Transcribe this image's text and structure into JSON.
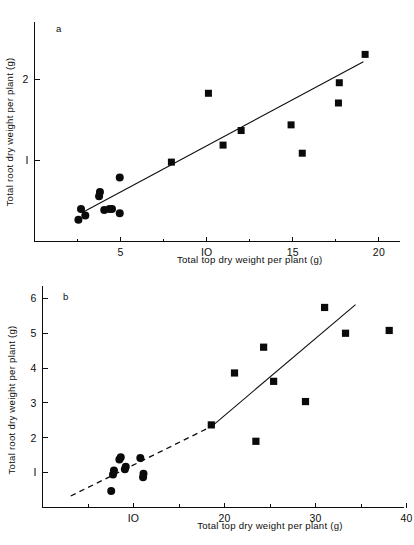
{
  "figure": {
    "panels": [
      {
        "id": "a",
        "letter": "a",
        "xlabel": "Total top dry weight per plant (g)",
        "ylabel": "Total root dry weight per plant (g)",
        "xticks": [
          5,
          10,
          15,
          20
        ],
        "yticks": [
          1,
          2
        ],
        "xlim": [
          0.0,
          21.2
        ],
        "ylim": [
          0.0,
          2.42
        ]
      },
      {
        "id": "b",
        "letter": "b",
        "xlabel": "Total top dry weight per plant (g)",
        "ylabel": "Total root dry weight per plant (g)",
        "xticks": [
          10,
          20,
          30,
          40
        ],
        "yticks": [
          1,
          2,
          3,
          4,
          5,
          6
        ],
        "xlim": [
          0.0,
          41.5
        ],
        "ylim": [
          0.0,
          6.28
        ]
      }
    ]
  },
  "chart_data": [
    {
      "type": "scatter",
      "panel": "a",
      "title": "",
      "xlabel": "Total top dry weight per plant (g)",
      "ylabel": "Total root dry weight per plant (g)",
      "xlim": [
        0.0,
        21.2
      ],
      "ylim": [
        0.0,
        2.42
      ],
      "xticks": [
        5,
        10,
        15,
        20
      ],
      "yticks": [
        1,
        2
      ],
      "grid": false,
      "legend": null,
      "annotations": [
        "a"
      ],
      "series": [
        {
          "name": "circles",
          "marker": "circle",
          "color": "#0a0a0a",
          "points": [
            [
              2.55,
              0.27
            ],
            [
              2.7,
              0.4
            ],
            [
              2.95,
              0.32
            ],
            [
              3.75,
              0.56
            ],
            [
              3.8,
              0.61
            ],
            [
              4.05,
              0.39
            ],
            [
              4.35,
              0.4
            ],
            [
              4.5,
              0.4
            ],
            [
              4.95,
              0.35
            ],
            [
              4.95,
              0.79
            ]
          ]
        },
        {
          "name": "squares",
          "marker": "square",
          "color": "#0a0a0a",
          "points": [
            [
              7.95,
              0.98
            ],
            [
              10.1,
              1.83
            ],
            [
              10.95,
              1.19
            ],
            [
              12.0,
              1.37
            ],
            [
              14.9,
              1.44
            ],
            [
              15.55,
              1.09
            ],
            [
              17.65,
              1.71
            ],
            [
              17.7,
              1.96
            ],
            [
              19.2,
              2.31
            ]
          ]
        }
      ],
      "fit_lines": [
        {
          "name": "regression-line-a",
          "style": "solid",
          "x_start": 2.75,
          "y_start": 0.355,
          "x_end": 19.1,
          "y_end": 2.22
        }
      ]
    },
    {
      "type": "scatter",
      "panel": "b",
      "title": "",
      "xlabel": "Total top dry weight per plant (g)",
      "ylabel": "Total root dry weight per plant (g)",
      "xlim": [
        0.0,
        41.5
      ],
      "ylim": [
        0.0,
        6.28
      ],
      "xticks": [
        10,
        20,
        30,
        40
      ],
      "yticks": [
        1,
        2,
        3,
        4,
        5,
        6
      ],
      "grid": false,
      "legend": null,
      "annotations": [
        "b"
      ],
      "series": [
        {
          "name": "circles",
          "marker": "circle",
          "color": "#0a0a0a",
          "points": [
            [
              7.55,
              0.47
            ],
            [
              7.75,
              0.95
            ],
            [
              7.85,
              1.06
            ],
            [
              8.45,
              1.38
            ],
            [
              8.6,
              1.44
            ],
            [
              9.05,
              1.1
            ],
            [
              9.15,
              1.17
            ],
            [
              10.75,
              1.42
            ],
            [
              11.05,
              0.87
            ],
            [
              11.1,
              0.97
            ]
          ]
        },
        {
          "name": "squares",
          "marker": "square",
          "color": "#0a0a0a",
          "points": [
            [
              18.55,
              2.37
            ],
            [
              21.1,
              3.86
            ],
            [
              23.45,
              1.9
            ],
            [
              24.3,
              4.6
            ],
            [
              25.4,
              3.62
            ],
            [
              28.9,
              3.04
            ],
            [
              31.0,
              5.74
            ],
            [
              33.3,
              5.0
            ],
            [
              38.1,
              5.08
            ]
          ]
        }
      ],
      "fit_lines": [
        {
          "name": "regression-line-b-extrapolated",
          "style": "dashed",
          "x_start": 3.1,
          "y_start": 0.33,
          "x_end": 18.6,
          "y_end": 2.33
        },
        {
          "name": "regression-line-b",
          "style": "solid",
          "x_start": 18.6,
          "y_start": 2.33,
          "x_end": 34.4,
          "y_end": 5.82
        }
      ]
    }
  ]
}
